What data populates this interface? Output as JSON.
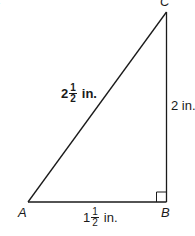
{
  "figure": {
    "corner_label": "A.",
    "vertices": {
      "A": {
        "label": "A"
      },
      "B": {
        "label": "B"
      },
      "C": {
        "label": "C"
      }
    },
    "sides": {
      "hypotenuse_AC": {
        "whole": "2",
        "num": "1",
        "den": "2",
        "unit": "in."
      },
      "vertical_BC": {
        "text": "2 in."
      },
      "horizontal_AB": {
        "whole": "1",
        "num": "1",
        "den": "2",
        "unit": "in."
      }
    },
    "right_angle_at": "B",
    "colors": {
      "line": "#1a1a1a",
      "background": "#ffffff"
    }
  }
}
